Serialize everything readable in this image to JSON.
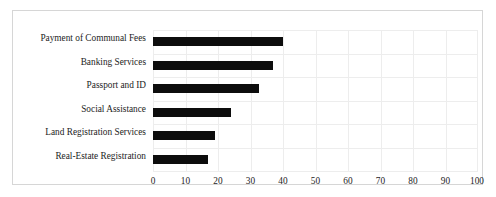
{
  "chart_data": {
    "type": "bar",
    "orientation": "horizontal",
    "title": "",
    "subtitle": "",
    "xlabel": "",
    "ylabel": "",
    "xlim": [
      0,
      100
    ],
    "xticks": [
      0,
      10,
      20,
      30,
      40,
      50,
      60,
      70,
      80,
      90,
      100
    ],
    "grid": true,
    "legend": false,
    "legend_position": "none",
    "bar_color": "#0d0d0d",
    "grid_color": "#ededed",
    "frame_color": "#d6d6d6",
    "background": "#ffffff",
    "categories": [
      "Payment of Communal Fees",
      "Banking Services",
      "Passport and ID",
      "Social Assistance",
      "Land Registration Services",
      "Real-Estate Registration"
    ],
    "values": [
      40,
      37,
      32.5,
      24,
      19,
      17
    ]
  }
}
